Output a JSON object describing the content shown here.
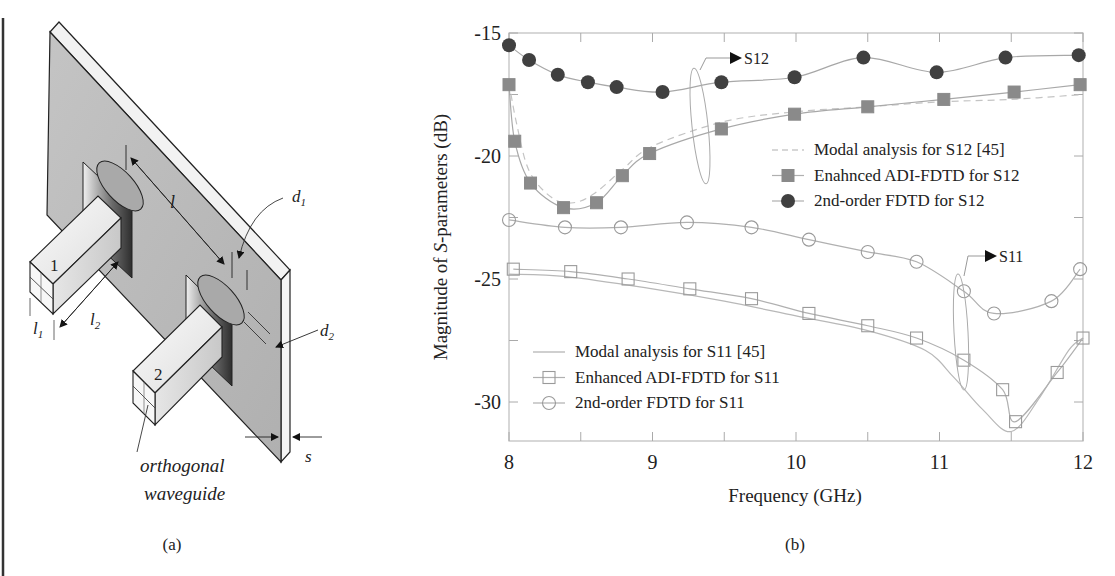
{
  "panel_a": {
    "caption": "(a)",
    "labels": {
      "port1": "1",
      "port2": "2",
      "l": "l",
      "l1": "l",
      "l1_sub": "1",
      "l2": "l",
      "l2_sub": "2",
      "d1": "d",
      "d1_sub": "1",
      "d2": "d",
      "d2_sub": "2",
      "s": "s",
      "orthogonal_line1": "orthogonal",
      "orthogonal_line2": "waveguide"
    }
  },
  "panel_b": {
    "caption": "(b)"
  },
  "chart_data": {
    "type": "line",
    "title": "",
    "xlabel": "Frequency (GHz)",
    "ylabel": "Magnitude of S-parameters (dB)",
    "ylabel_parts": [
      "Magnitude of ",
      "S",
      "-parameters (dB)"
    ],
    "xlim": [
      8,
      12
    ],
    "ylim": [
      -31.6,
      -15
    ],
    "xticks": [
      8,
      9,
      10,
      11,
      12
    ],
    "xtick_labels": [
      "8",
      "9",
      "10",
      "11",
      "12"
    ],
    "yticks": [
      -15,
      -20,
      -25,
      -30
    ],
    "ytick_labels": [
      "-15",
      "-20",
      "-25",
      "-30"
    ],
    "grid": false,
    "annotations": [
      {
        "text": "S12",
        "x": 9.75,
        "y": -15.9
      },
      {
        "text": "S11",
        "x": 11.45,
        "y": -24.5
      }
    ],
    "legends": [
      {
        "position": "upper right",
        "entries": [
          "Modal analysis for S12 [45]",
          "Enahnced ADI-FDTD for S12",
          "2nd-order FDTD for S12"
        ]
      },
      {
        "position": "lower left",
        "entries": [
          "Modal analysis for S11 [45]",
          "Enhanced ADI-FDTD for S11",
          "2nd-order FDTD for S11"
        ]
      }
    ],
    "series": [
      {
        "name": "Modal analysis for S12 [45]",
        "style": "dashed",
        "marker": "none",
        "color": "#b0b0b0",
        "x": [
          8.0,
          8.05,
          8.14,
          8.3,
          8.45,
          8.6,
          8.8,
          9.0,
          9.5,
          10.0,
          10.5,
          11.0,
          11.5,
          12.0
        ],
        "y": [
          -17.0,
          -18.6,
          -20.6,
          -21.7,
          -21.9,
          -21.5,
          -20.5,
          -19.6,
          -18.6,
          -18.2,
          -18.0,
          -17.8,
          -17.7,
          -17.5
        ]
      },
      {
        "name": "Enahnced ADI-FDTD for S12",
        "style": "solid",
        "marker": "filled-square",
        "color": "#808080",
        "x": [
          8.0,
          8.04,
          8.15,
          8.38,
          8.61,
          8.79,
          8.98,
          9.48,
          9.99,
          10.5,
          11.03,
          11.52,
          11.98
        ],
        "y": [
          -17.1,
          -19.4,
          -21.1,
          -22.1,
          -21.9,
          -20.8,
          -19.9,
          -18.9,
          -18.3,
          -18.0,
          -17.7,
          -17.4,
          -17.1
        ]
      },
      {
        "name": "2nd-order FDTD for S12",
        "style": "solid",
        "marker": "filled-circle",
        "color": "#404040",
        "x": [
          8.0,
          8.14,
          8.34,
          8.55,
          8.75,
          9.07,
          9.48,
          9.99,
          10.47,
          10.98,
          11.46,
          11.97
        ],
        "y": [
          -15.5,
          -16.1,
          -16.7,
          -17.0,
          -17.2,
          -17.4,
          -17.0,
          -16.8,
          -16.0,
          -16.6,
          -16.0,
          -15.9
        ]
      },
      {
        "name": "Modal analysis for S11 [45]",
        "style": "solid",
        "marker": "none",
        "color": "#a0a0a0",
        "x": [
          8.0,
          8.4,
          9.0,
          9.5,
          10.0,
          10.5,
          10.9,
          11.1,
          11.3,
          11.5,
          11.7,
          11.9,
          12.0
        ],
        "y": [
          -24.8,
          -24.9,
          -25.4,
          -25.9,
          -26.5,
          -27.1,
          -27.9,
          -29.0,
          -30.3,
          -31.2,
          -29.8,
          -27.9,
          -27.4
        ]
      },
      {
        "name": "Enhanced ADI-FDTD for S11",
        "style": "solid",
        "marker": "open-square",
        "color": "#909090",
        "x": [
          8.03,
          8.43,
          8.83,
          9.26,
          9.69,
          10.09,
          10.5,
          10.84,
          11.17,
          11.44,
          11.53,
          11.82,
          12.0
        ],
        "y": [
          -24.6,
          -24.7,
          -25.0,
          -25.4,
          -25.8,
          -26.4,
          -26.9,
          -27.4,
          -28.3,
          -29.5,
          -30.8,
          -28.8,
          -27.4
        ]
      },
      {
        "name": "2nd-order FDTD for S11",
        "style": "solid",
        "marker": "open-circle",
        "color": "#909090",
        "x": [
          8.0,
          8.39,
          8.78,
          9.24,
          9.69,
          10.09,
          10.5,
          10.84,
          11.17,
          11.38,
          11.78,
          11.98
        ],
        "y": [
          -22.6,
          -22.9,
          -22.9,
          -22.7,
          -22.9,
          -23.4,
          -23.9,
          -24.3,
          -25.5,
          -26.4,
          -25.9,
          -24.6
        ]
      }
    ]
  }
}
